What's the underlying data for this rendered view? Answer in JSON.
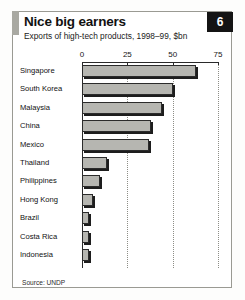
{
  "panel": {
    "badge_number": "6",
    "accent_color": "#a9a9a2",
    "frame_color": "#9a9a93"
  },
  "header": {
    "title": "Nice big earners",
    "subtitle": "Exports of high-tech products, 1998–99, $bn"
  },
  "footer": {
    "source": "Source: UNDP"
  },
  "chart_data": {
    "type": "bar",
    "orientation": "horizontal",
    "title": "Nice big earners",
    "subtitle": "Exports of high-tech products, 1998–99, $bn",
    "xlabel": "",
    "ylabel": "",
    "xlim": [
      0,
      75
    ],
    "tick_labels": [
      "0",
      "25",
      "50",
      "75"
    ],
    "ticks": [
      0,
      25,
      50,
      75
    ],
    "grid": "vertical-dotted",
    "legend": "none",
    "bar_color": "#b6b6b1",
    "bar_border_color": "#2b2b2b",
    "categories": [
      "Singapore",
      "South Korea",
      "Malaysia",
      "China",
      "Mexico",
      "Thailand",
      "Philippines",
      "Hong Kong",
      "Brazil",
      "Costa Rica",
      "Indonesia"
    ],
    "values": [
      63,
      50,
      44,
      38,
      37,
      14,
      10,
      6,
      4,
      4,
      4
    ],
    "units": "$bn",
    "source": "Source: UNDP"
  }
}
